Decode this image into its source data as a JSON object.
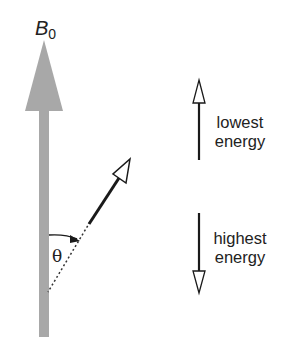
{
  "diagram": {
    "field_label": {
      "main": "B",
      "subscript": "0"
    },
    "angle_label": "θ",
    "states": [
      {
        "direction": "up",
        "label_line1": "lowest",
        "label_line2": "energy"
      },
      {
        "direction": "down",
        "label_line1": "highest",
        "label_line2": "energy"
      }
    ],
    "colors": {
      "field_arrow": "#a8a8a8",
      "moment_arrow": "#1a1a1a",
      "text": "#222222",
      "background": "#ffffff"
    }
  }
}
